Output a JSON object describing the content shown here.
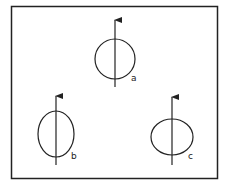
{
  "diagram": {
    "figures": [
      {
        "id": "a",
        "label": "a",
        "shape": "circle"
      },
      {
        "id": "b",
        "label": "b",
        "shape": "vertically elongated ellipse"
      },
      {
        "id": "c",
        "label": "c",
        "shape": "horizontally elongated ellipse"
      }
    ],
    "stroke_color": "#222222",
    "background_color": "#ffffff"
  }
}
